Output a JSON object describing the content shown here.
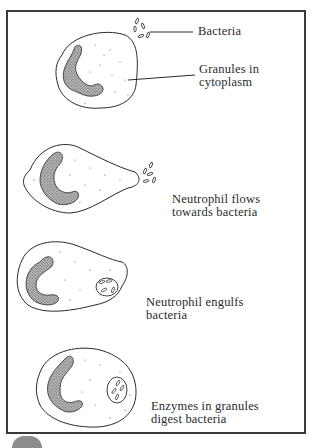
{
  "diagram": {
    "stages": [
      {
        "id": "stage-1",
        "labels": [
          "Bacteria",
          "Granules in cytoplasm"
        ]
      },
      {
        "id": "stage-2",
        "caption_line1": "Neutrophil flows",
        "caption_line2": "towards bacteria"
      },
      {
        "id": "stage-3",
        "caption_line1": "Neutrophil engulfs",
        "caption_line2": "bacteria"
      },
      {
        "id": "stage-4",
        "caption_line1": "Enzymes in granules",
        "caption_line2": "digest bacteria"
      }
    ],
    "callouts": {
      "bacteria": "Bacteria",
      "granules_line1": "Granules in",
      "granules_line2": "cytoplasm"
    },
    "colors": {
      "ink": "#2a2a2a",
      "nucleus_fill": "#9a9a9a",
      "frame": "#3a3a3a",
      "background": "#ffffff"
    }
  }
}
